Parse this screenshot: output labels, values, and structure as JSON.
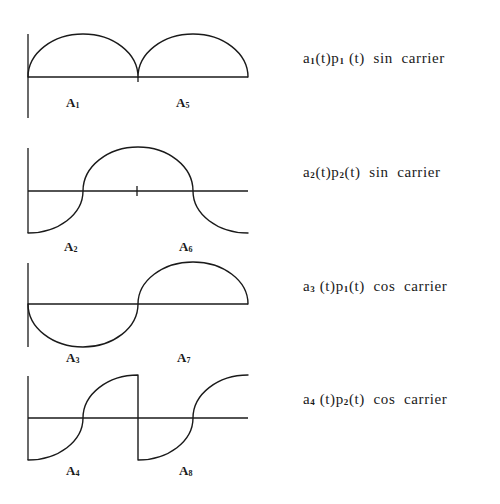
{
  "figure": {
    "panels": [
      {
        "id": 1,
        "waveform": "two positive half-sine arcs",
        "caption": {
          "a": "a",
          "a_sub": "1",
          "mid": "(t)p",
          "p_sub": "1",
          "end": " (t)",
          "carrier": "  sin  carrier"
        },
        "areas": [
          {
            "letter": "A",
            "index": "1"
          },
          {
            "letter": "A",
            "index": "5"
          }
        ]
      },
      {
        "id": 2,
        "waveform": "rises from negative to flat positive top, then falls back negative",
        "caption": {
          "a": "a",
          "a_sub": "2",
          "mid": "(t)p",
          "p_sub": "2",
          "end": "(t)",
          "carrier": "  sin  carrier"
        },
        "areas": [
          {
            "letter": "A",
            "index": "2"
          },
          {
            "letter": "A",
            "index": "6"
          }
        ]
      },
      {
        "id": 3,
        "waveform": "negative half-sine arc followed by positive half-sine arc",
        "caption": {
          "a": "a",
          "a_sub": "3",
          "mid": " (t)p",
          "p_sub": "1",
          "end": "(t)",
          "carrier": "  cos  carrier"
        },
        "areas": [
          {
            "letter": "A",
            "index": "3"
          },
          {
            "letter": "A",
            "index": "7"
          }
        ]
      },
      {
        "id": 4,
        "waveform": "two rising S-curves from negative to positive with a vertical drop between",
        "caption": {
          "a": "a",
          "a_sub": "4",
          "mid": " (t)p",
          "p_sub": "2",
          "end": "(t)",
          "carrier": "  cos  carrier"
        },
        "areas": [
          {
            "letter": "A",
            "index": "4"
          },
          {
            "letter": "A",
            "index": "8"
          }
        ]
      }
    ],
    "colors": {
      "ink": "#1a1a1a",
      "background": "#ffffff"
    }
  }
}
